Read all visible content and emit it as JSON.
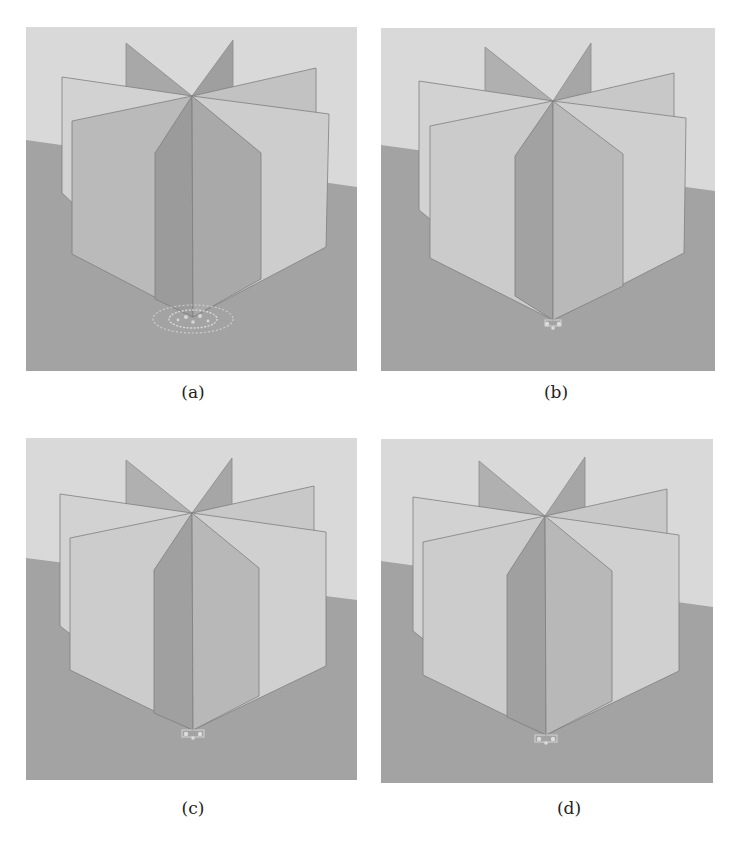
{
  "figure": {
    "top_text_fragment": "",
    "colors": {
      "sky": "#d9d9d9",
      "ground": "#a3a3a3",
      "blade_light": "#cfcfcf",
      "blade_mid": "#bdbdbd",
      "blade_dark": "#9d9d9d",
      "edge": "#7a7a7a",
      "caption_text": "#222222"
    },
    "panels": [
      {
        "id": "a",
        "caption": "(a)",
        "base_artifact": "strong"
      },
      {
        "id": "b",
        "caption": "(b)",
        "base_artifact": "weak"
      },
      {
        "id": "c",
        "caption": "(c)",
        "base_artifact": "weak"
      },
      {
        "id": "d",
        "caption": "(d)",
        "base_artifact": "weak"
      }
    ]
  }
}
